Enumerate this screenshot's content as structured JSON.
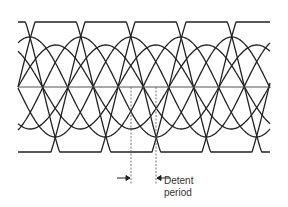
{
  "diagram": {
    "labels": {
      "line1": "Detent",
      "line2": "period"
    },
    "stroke_color": "#222222",
    "axis_color": "#555555",
    "center_y": 87,
    "x_start": 18,
    "x_end": 270,
    "period_px": 151,
    "families": [
      {
        "name": "outer",
        "amplitude": 74,
        "clip": 65,
        "phases": [
          0,
          50,
          100
        ]
      },
      {
        "name": "middle",
        "amplitude": 50,
        "clip": 0,
        "phases": [
          25,
          75,
          125
        ]
      },
      {
        "name": "inner",
        "amplitude": 42,
        "clip": 0,
        "phases": [
          0,
          50,
          100
        ]
      }
    ],
    "detent": {
      "dash_x1": 131,
      "dash_x2": 156,
      "dash_y_top": 87,
      "dash_y_bottom": 185,
      "arrow_y": 178
    }
  }
}
